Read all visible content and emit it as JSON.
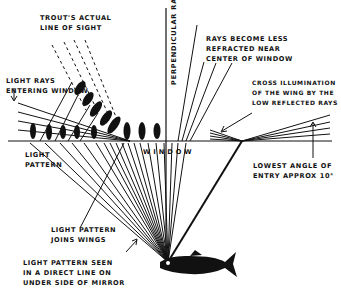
{
  "diagram": {
    "labels": {
      "trouts_sight": [
        "TROUT'S ACTUAL",
        "LINE OF SIGHT"
      ],
      "light_rays_entering": [
        "LIGHT RAYS",
        "ENTERING WINDOW"
      ],
      "light_pattern": [
        "LIGHT",
        "PATTERN"
      ],
      "perpendicular_rays": "PERPENDICULAR RAYS",
      "rays_less_refracted": [
        "RAYS BECOME LESS",
        "REFRACTED NEAR",
        "CENTER OF WINDOW"
      ],
      "cross_illumination": [
        "CROSS ILLUMINATION",
        "OF THE WING BY THE",
        "LOW REFLECTED RAYS"
      ],
      "window": "WINDOW",
      "lowest_angle": [
        "LOWEST ANGLE OF",
        "ENTRY APPROX 10°"
      ],
      "joins_wings": [
        "LIGHT PATTERN",
        "JOINS WINGS"
      ],
      "direct_line": [
        "LIGHT PATTERN SEEN",
        "IN A DIRECT LINE ON",
        "UNDER SIDE OF MIRROR"
      ]
    },
    "colors": {
      "ink": "#111111",
      "background": "#ffffff"
    },
    "icons": [
      "trout-icon",
      "mayfly-icon",
      "arrow-icon"
    ]
  }
}
